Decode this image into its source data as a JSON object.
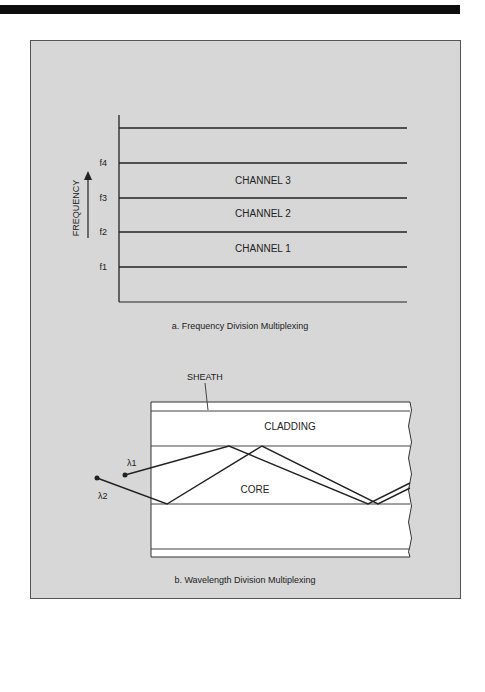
{
  "figure_a": {
    "caption": "a. Frequency Division Multiplexing",
    "axis_label": "FREQUENCY",
    "ticks": [
      "f4",
      "f3",
      "f2",
      "f1"
    ],
    "channels": [
      "CHANNEL 3",
      "CHANNEL 2",
      "CHANNEL 1"
    ]
  },
  "figure_b": {
    "caption": "b. Wavelength Division Multiplexing",
    "labels": {
      "sheath": "SHEATH",
      "cladding": "CLADDING",
      "core": "CORE",
      "lambda1": "λ1",
      "lambda2": "λ2"
    }
  },
  "colors": {
    "panel_bg": "#d7d7d7",
    "fiber_bg": "#ffffff",
    "line": "#222222"
  }
}
